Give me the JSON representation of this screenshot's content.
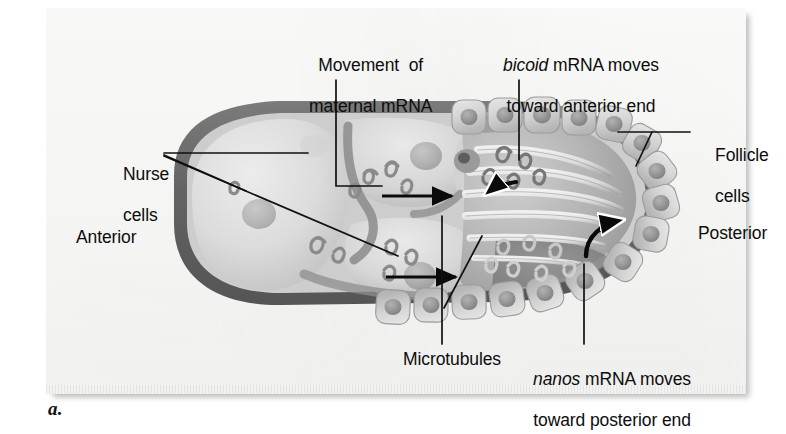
{
  "figure": {
    "caption": "a.",
    "title_alt": "Drosophila oocyte maternal mRNA transport diagram"
  },
  "labels": {
    "movement_line1": "Movement  of",
    "movement_line2": "maternal mRNA",
    "bicoid_italic": "bicoid",
    "bicoid_rest": " mRNA moves",
    "bicoid_line2": "toward anterior end",
    "nurse_line1": "Nurse",
    "nurse_line2": "cells",
    "anterior": "Anterior",
    "follicle_line1": "Follicle",
    "follicle_line2": "cells",
    "posterior": "Posterior",
    "microtubules": "Microtubules",
    "nanos_italic": "nanos",
    "nanos_rest": " mRNA moves",
    "nanos_line2": "toward posterior end"
  },
  "colors": {
    "text": "#0d0d0d",
    "leader_line": "#111111",
    "arrow": "#0a0a0a",
    "membrane_dark": "#6d6d6d",
    "membrane_darker": "#5a5a5a",
    "cytoplasm_light": "#dcdcdc",
    "cytoplasm_mid": "#c2c2c2",
    "oocyte_fill": "#b9b9b9",
    "follicle_fill": "#d5d5d5",
    "nucleus_fill": "#9a9a9a",
    "microtubule": "#e4e4e4",
    "paper": "#fbfbfa"
  },
  "structures": {
    "nurse_cells_count": 4,
    "follicle_cells_count": 16,
    "microtubule_bundles": 6,
    "mrna_squiggle_clusters": 9,
    "straight_arrows": 2,
    "curved_arrows": 2
  }
}
